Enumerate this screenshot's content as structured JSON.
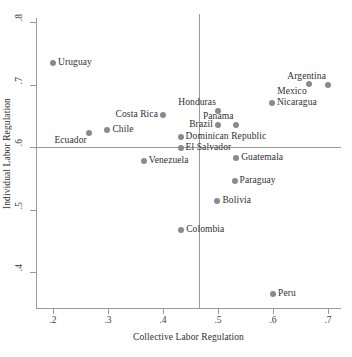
{
  "chart_data": {
    "type": "scatter",
    "title": "",
    "xlabel": "Collective Labor Regulation",
    "ylabel": "Individual Labor Regulation",
    "xlim": [
      0.175,
      0.73
    ],
    "ylim": [
      0.355,
      0.815
    ],
    "xticks": [
      ".2",
      ".3",
      ".4",
      ".5",
      ".6",
      ".7"
    ],
    "xtick_values": [
      0.2,
      0.3,
      0.4,
      0.5,
      0.6,
      0.7
    ],
    "yticks": [
      ".8",
      ".7",
      ".6",
      ".5",
      ".4"
    ],
    "ytick_values": [
      0.8,
      0.7,
      0.6,
      0.5,
      0.4
    ],
    "grid": false,
    "legend": false,
    "reference_lines": [
      {
        "name": "vertical-mean",
        "axis": "x",
        "value": 0.465
      },
      {
        "name": "horizontal-mean",
        "axis": "y",
        "value": 0.6
      }
    ],
    "marker_color": "#8a8a8a",
    "axis_color": "#9a9a9a",
    "text_color": "#2f2f2f",
    "points": [
      {
        "label": "Uruguay",
        "x": 0.2,
        "y": 0.735,
        "label_side": "right"
      },
      {
        "label": "Argentina",
        "x": 0.7,
        "y": 0.7,
        "label_side": "above-left"
      },
      {
        "label": "Mexico",
        "x": 0.665,
        "y": 0.701,
        "label_side": "below-left"
      },
      {
        "label": "Nicaragua",
        "x": 0.598,
        "y": 0.67,
        "label_side": "right"
      },
      {
        "label": "Honduras",
        "x": 0.5,
        "y": 0.657,
        "label_side": "above-left"
      },
      {
        "label": "Costa Rica",
        "x": 0.4,
        "y": 0.651,
        "label_side": "left"
      },
      {
        "label": "Panama",
        "x": 0.532,
        "y": 0.635,
        "label_side": "above-left"
      },
      {
        "label": "Brazil",
        "x": 0.5,
        "y": 0.635,
        "label_side": "left"
      },
      {
        "label": "Chile",
        "x": 0.299,
        "y": 0.628,
        "label_side": "right"
      },
      {
        "label": "Ecuador",
        "x": 0.265,
        "y": 0.623,
        "label_side": "below-left"
      },
      {
        "label": "Dominican Republic",
        "x": 0.432,
        "y": 0.616,
        "label_side": "right"
      },
      {
        "label": "El Salvador",
        "x": 0.432,
        "y": 0.599,
        "label_side": "right"
      },
      {
        "label": "Guatemala",
        "x": 0.533,
        "y": 0.583,
        "label_side": "right"
      },
      {
        "label": "Venezuela",
        "x": 0.365,
        "y": 0.578,
        "label_side": "right"
      },
      {
        "label": "Paraguay",
        "x": 0.53,
        "y": 0.546,
        "label_side": "right"
      },
      {
        "label": "Bolivia",
        "x": 0.499,
        "y": 0.514,
        "label_side": "right"
      },
      {
        "label": "Colombia",
        "x": 0.433,
        "y": 0.468,
        "label_side": "right"
      },
      {
        "label": "Peru",
        "x": 0.6,
        "y": 0.365,
        "label_side": "right"
      }
    ]
  }
}
